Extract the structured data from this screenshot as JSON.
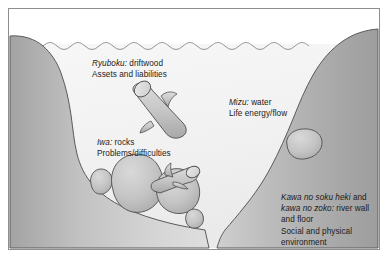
{
  "figure": {
    "frame_border_color": "#8e8e8e",
    "background_color": "#ffffff"
  },
  "palette": {
    "bank_light": "#d7d7d7",
    "bank_dark": "#a9a9a9",
    "bank_outline": "#5a5a5a",
    "water_fill": "#f2f2f2",
    "water_outline": "#8a8a8a",
    "rock_fill": "#c3c3c3",
    "rock_outline": "#4f4f4f",
    "driftwood_fill": "#c9c9c9",
    "driftwood_outline": "#4f4f4f",
    "text_color": "#1b1b1b"
  },
  "labels": {
    "ryuboku": {
      "term": "Ryuboku:",
      "gloss": " driftwood",
      "meaning": "Assets and liabilities"
    },
    "mizu": {
      "term": "Mizu:",
      "gloss": " water",
      "meaning": "Life energy/flow"
    },
    "iwa": {
      "term": "Iwa:",
      "gloss": " rocks",
      "meaning": "Problems/difficulties"
    },
    "kawa": {
      "term": "Kawa no soku heki",
      "conjunction": " and",
      "term2": "kawa no zoko:",
      "gloss2": " river wall",
      "gloss3": "and floor",
      "meaning_line1": "Social and physical",
      "meaning_line2": "environment"
    }
  },
  "elements": {
    "left_bank": "left-river-bank",
    "right_bank": "right-river-bank",
    "water_body": "river-water",
    "water_surface": "water-surface-waves",
    "driftwood_main": "driftwood-log-upper",
    "driftwood_lower": "driftwood-log-lower",
    "rock_small_left": "rock-small-left",
    "rock_large_center": "rock-large-center",
    "rock_right_cluster": "rock-right-cluster",
    "rock_bottom_small": "rock-bottom-small",
    "rock_right_slope": "rock-right-slope"
  }
}
